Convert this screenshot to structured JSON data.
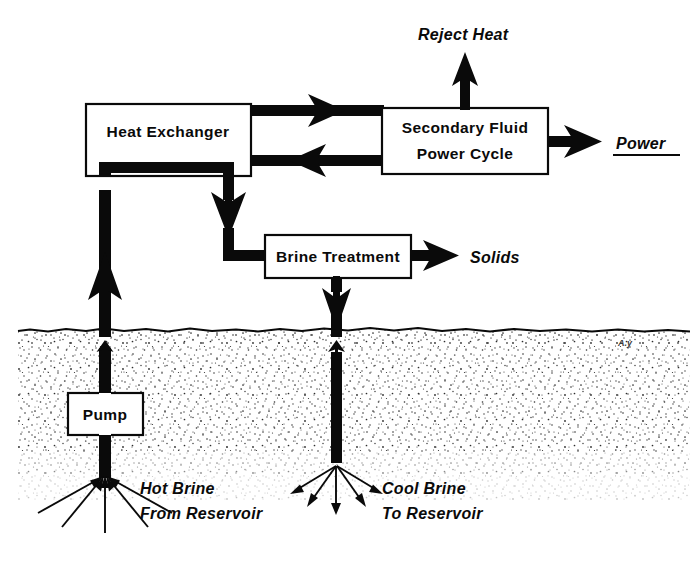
{
  "diagram": {
    "boxes": {
      "heat_exchanger": {
        "label": "Heat Exchanger"
      },
      "secondary_fluid": {
        "label_line1": "Secondary Fluid",
        "label_line2": "Power Cycle"
      },
      "brine_treatment": {
        "label": "Brine Treatment"
      },
      "pump": {
        "label": "Pump"
      }
    },
    "flow_labels": {
      "reject_heat": "Reject Heat",
      "power": "Power",
      "solids": "Solids",
      "hot_brine_line1": "Hot Brine",
      "hot_brine_line2": "From Reservoir",
      "cool_brine_line1": "Cool Brine",
      "cool_brine_line2": "To Reservoir"
    },
    "signature": "A.y",
    "colors": {
      "ink": "#0a0a0a",
      "background": "#ffffff",
      "soil_stipple": "#2b2b2b",
      "box_fill": "#ffffff"
    }
  }
}
